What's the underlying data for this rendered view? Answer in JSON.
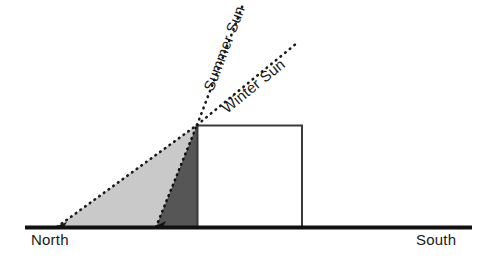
{
  "diagram": {
    "ground": {
      "north_label": "North",
      "south_label": "South",
      "line_color": "#111111",
      "x_start": 25,
      "x_end": 472,
      "y": 227,
      "thickness": 4
    },
    "building": {
      "name": "building",
      "x_left": 197,
      "x_right": 302,
      "y_top": 125,
      "y_bottom": 227,
      "fill_color": "#ffffff",
      "stroke_color": "#3a3a3a"
    },
    "rays": [
      {
        "id": "summer-sun-ray",
        "label": "Summer Sun",
        "from_x": 197,
        "from_y": 125,
        "to_x": 244,
        "to_y": 2,
        "angle_deg": -69,
        "style": "dotted",
        "color": "#1a1a1a",
        "label_x": 213,
        "label_y": 92,
        "label_rotation": -69
      },
      {
        "id": "winter-sun-ray",
        "label": "Winter Sun",
        "from_x": 197,
        "from_y": 125,
        "to_x": 297,
        "to_y": 43,
        "angle_deg": -39,
        "style": "dotted",
        "color": "#1a1a1a",
        "label_x": 227,
        "label_y": 114,
        "label_rotation": -39
      }
    ],
    "shadows": [
      {
        "id": "winter-shadow",
        "name": "long-light-shadow",
        "description": "Long light-gray winter shadow cast to the north",
        "fill_color": "#c9c9c9",
        "edge_style": "dotted",
        "edge_color": "#1a1a1a",
        "tip_x": 57,
        "apex_x": 197,
        "apex_y": 125,
        "base_y": 227
      },
      {
        "id": "summer-shadow",
        "name": "short-dark-shadow",
        "description": "Short dark-gray summer shadow cast to the north",
        "fill_color": "#565656",
        "edge_style": "dotted",
        "edge_color": "#111111",
        "tip_x": 156,
        "apex_x": 197,
        "apex_y": 125,
        "base_y": 227
      }
    ]
  }
}
